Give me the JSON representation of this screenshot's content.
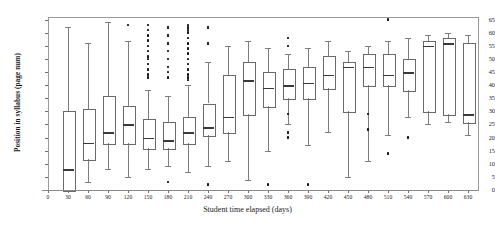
{
  "chart_data": {
    "type": "box",
    "title": "",
    "xlabel": "Student time elapsed (days)",
    "ylabel": "Position in syllabus (page num)",
    "xlim": [
      0,
      645
    ],
    "ylim": [
      0,
      66
    ],
    "grid": false,
    "legend": "none",
    "xticks": [
      0,
      30,
      60,
      90,
      120,
      150,
      180,
      210,
      240,
      270,
      300,
      330,
      360,
      390,
      420,
      450,
      480,
      510,
      540,
      570,
      600,
      630
    ],
    "xtick_labels": [
      "0",
      "30",
      "60",
      "90",
      "120",
      "150",
      "180",
      "210",
      "240",
      "270",
      "300",
      "330",
      "360",
      "390",
      "420",
      "450",
      "480",
      "510",
      "540",
      "570",
      "600",
      "630"
    ],
    "yticks": [
      0,
      5,
      10,
      15,
      20,
      25,
      30,
      35,
      40,
      45,
      50,
      55,
      60,
      65
    ],
    "ytick_labels": [
      "0",
      "5",
      "10",
      "15",
      "20",
      "25",
      "30",
      "35",
      "40",
      "45",
      "50",
      "55",
      "60",
      "65"
    ],
    "boxes": [
      {
        "x": 30,
        "whisker_low": 0,
        "q1": 0,
        "median": 8,
        "q3": 30,
        "whisker_high": 62,
        "outliers": []
      },
      {
        "x": 60,
        "whisker_low": 3,
        "q1": 12,
        "median": 18,
        "q3": 31,
        "whisker_high": 56,
        "outliers": []
      },
      {
        "x": 90,
        "whisker_low": 8,
        "q1": 18,
        "median": 22,
        "q3": 36,
        "whisker_high": 64,
        "outliers": []
      },
      {
        "x": 120,
        "whisker_low": 5,
        "q1": 18,
        "median": 25,
        "q3": 32,
        "whisker_high": 57,
        "outliers": [
          63
        ]
      },
      {
        "x": 150,
        "whisker_low": 8,
        "q1": 16,
        "median": 20,
        "q3": 27,
        "whisker_high": 38,
        "outliers": [
          43,
          44,
          46,
          48,
          50,
          51,
          53,
          55,
          57,
          59,
          61,
          63
        ]
      },
      {
        "x": 180,
        "whisker_low": 9,
        "q1": 16,
        "median": 19,
        "q3": 26,
        "whisker_high": 36,
        "outliers": [
          3,
          43,
          45,
          47,
          50,
          53,
          56,
          59,
          62
        ]
      },
      {
        "x": 210,
        "whisker_low": 7,
        "q1": 18,
        "median": 22,
        "q3": 28,
        "whisker_high": 40,
        "outliers": [
          42,
          43,
          44,
          46,
          48,
          50,
          52,
          54,
          56,
          58,
          60,
          61,
          62,
          63
        ]
      },
      {
        "x": 240,
        "whisker_low": 9,
        "q1": 21,
        "median": 24,
        "q3": 33,
        "whisker_high": 49,
        "outliers": [
          2,
          56,
          62
        ]
      },
      {
        "x": 270,
        "whisker_low": 11,
        "q1": 22,
        "median": 28,
        "q3": 44,
        "whisker_high": 55,
        "outliers": []
      },
      {
        "x": 300,
        "whisker_low": 4,
        "q1": 29,
        "median": 42,
        "q3": 49,
        "whisker_high": 57,
        "outliers": []
      },
      {
        "x": 330,
        "whisker_low": 15,
        "q1": 32,
        "median": 39,
        "q3": 45,
        "whisker_high": 54,
        "outliers": [
          2
        ]
      },
      {
        "x": 360,
        "whisker_low": 25,
        "q1": 35,
        "median": 40,
        "q3": 46,
        "whisker_high": 52,
        "outliers": [
          20,
          22,
          29,
          55,
          58
        ]
      },
      {
        "x": 390,
        "whisker_low": 17,
        "q1": 35,
        "median": 41,
        "q3": 47,
        "whisker_high": 54,
        "outliers": [
          2
        ]
      },
      {
        "x": 420,
        "whisker_low": 22,
        "q1": 39,
        "median": 44,
        "q3": 51,
        "whisker_high": 57,
        "outliers": []
      },
      {
        "x": 450,
        "whisker_low": 5,
        "q1": 30,
        "median": 47,
        "q3": 49,
        "whisker_high": 53,
        "outliers": []
      },
      {
        "x": 480,
        "whisker_low": 11,
        "q1": 40,
        "median": 47,
        "q3": 52,
        "whisker_high": 55,
        "outliers": [
          23,
          29
        ]
      },
      {
        "x": 510,
        "whisker_low": 21,
        "q1": 40,
        "median": 44,
        "q3": 52,
        "whisker_high": 57,
        "outliers": [
          14,
          65
        ]
      },
      {
        "x": 540,
        "whisker_low": 28,
        "q1": 38,
        "median": 45,
        "q3": 50,
        "whisker_high": 58,
        "outliers": [
          20
        ]
      },
      {
        "x": 570,
        "whisker_low": 25,
        "q1": 30,
        "median": 55,
        "q3": 57,
        "whisker_high": 59,
        "outliers": []
      },
      {
        "x": 600,
        "whisker_low": 26,
        "q1": 29,
        "median": 56,
        "q3": 58,
        "whisker_high": 60,
        "outliers": []
      },
      {
        "x": 630,
        "whisker_low": 21,
        "q1": 26,
        "median": 29,
        "q3": 56,
        "whisker_high": 59,
        "outliers": []
      }
    ]
  }
}
